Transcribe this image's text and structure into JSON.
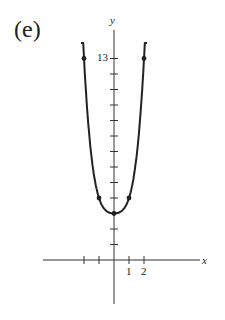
{
  "panel_label": "(e)",
  "chart_data": {
    "type": "line",
    "title": "",
    "xlabel": "x",
    "ylabel": "y",
    "x_tick_labels": [
      "1",
      "2"
    ],
    "y_tick_labels": [
      "13"
    ],
    "xlim": [
      -3,
      6
    ],
    "ylim": [
      -3,
      15
    ],
    "grid": false,
    "legend": null,
    "x_ticks": [
      -2,
      -1,
      1,
      2
    ],
    "y_ticks": [
      1,
      2,
      3,
      4,
      5,
      6,
      7,
      8,
      9,
      10,
      11,
      12,
      13
    ],
    "marked_points": [
      {
        "x": -2,
        "y": 13
      },
      {
        "x": -1,
        "y": 4
      },
      {
        "x": 0,
        "y": 3
      },
      {
        "x": 1,
        "y": 4
      },
      {
        "x": 2,
        "y": 13
      }
    ],
    "series": [
      {
        "name": "curve",
        "x": [
          -2.2,
          -2,
          -1.5,
          -1,
          -0.5,
          0,
          0.5,
          1,
          1.5,
          2,
          2.2
        ],
        "values": [
          15.0,
          13,
          7.2,
          4,
          3.2,
          3,
          3.2,
          4,
          7.2,
          13,
          15.0
        ]
      }
    ],
    "curve_ends": "arrows-up"
  },
  "axis_labels": {
    "x": "x",
    "y": "y",
    "x1": "1",
    "x2": "2",
    "y13": "13"
  }
}
